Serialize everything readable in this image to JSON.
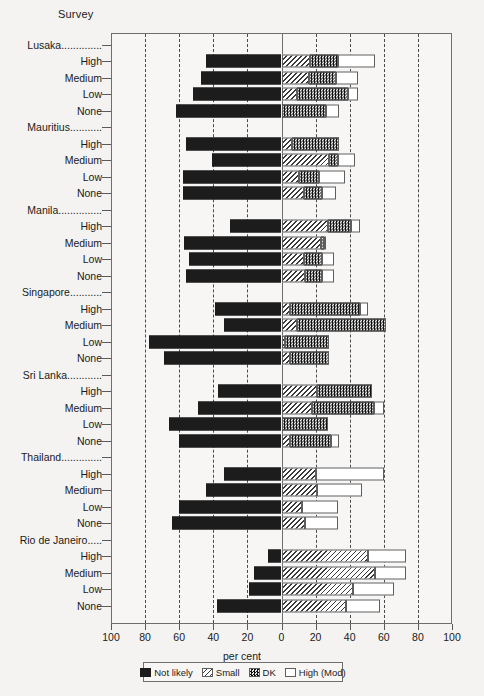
{
  "header": {
    "survey_label": "Survey"
  },
  "axis": {
    "x_title": "per cent",
    "x_ticks": [
      {
        "label": "100",
        "value": -100
      },
      {
        "label": "80",
        "value": -80
      },
      {
        "label": "60",
        "value": -60
      },
      {
        "label": "40",
        "value": -40
      },
      {
        "label": "20",
        "value": -20
      },
      {
        "label": "0",
        "value": 0
      },
      {
        "label": "20",
        "value": 20
      },
      {
        "label": "40",
        "value": 40
      },
      {
        "label": "60",
        "value": 60
      },
      {
        "label": "80",
        "value": 80
      },
      {
        "label": "100",
        "value": 100
      }
    ]
  },
  "legend": {
    "items": [
      {
        "key": "not_likely",
        "label": "Not likely",
        "swatch": "solid-black-swatch"
      },
      {
        "key": "small",
        "label": "Small",
        "swatch": "diagonal-hatch-swatch"
      },
      {
        "key": "dk",
        "label": "DK",
        "swatch": "dotted-dense-swatch"
      },
      {
        "key": "high_mod",
        "label": "High (Mod)",
        "swatch": "empty-white-swatch"
      }
    ]
  },
  "colors": {
    "not_likely": "#1c1c1c",
    "small": "#ffffff",
    "dk": "#111111",
    "high_mod": "#ffffff",
    "frame": "#6e6e6e",
    "grid": "#4a4a4a",
    "background": "#f4f3f1"
  },
  "chart_data": {
    "type": "bar",
    "title": "",
    "subtitle": "",
    "xlabel": "per cent",
    "ylabel": "Survey",
    "orientation": "horizontal",
    "stacked": true,
    "diverging": true,
    "xlim": [
      -100,
      100
    ],
    "grid": true,
    "legend_position": "bottom",
    "series": [
      {
        "name": "Not likely",
        "direction": "left"
      },
      {
        "name": "Small",
        "direction": "right"
      },
      {
        "name": "DK",
        "direction": "right"
      },
      {
        "name": "High (Mod)",
        "direction": "right"
      }
    ],
    "groups": [
      {
        "name": "Lusaka..............",
        "rows": [
          {
            "label": "High",
            "not_likely": 44,
            "small": 17,
            "dk": 16,
            "high_mod": 22
          },
          {
            "label": "Medium",
            "not_likely": 47,
            "small": 16,
            "dk": 16,
            "high_mod": 13
          },
          {
            "label": "Low",
            "not_likely": 52,
            "small": 9,
            "dk": 30,
            "high_mod": 6
          },
          {
            "label": "None",
            "not_likely": 62,
            "small": 0,
            "dk": 26,
            "high_mod": 8
          }
        ]
      },
      {
        "name": "Mauritius...........",
        "rows": [
          {
            "label": "High",
            "not_likely": 56,
            "small": 6,
            "dk": 28,
            "high_mod": 0
          },
          {
            "label": "Medium",
            "not_likely": 41,
            "small": 28,
            "dk": 5,
            "high_mod": 10
          },
          {
            "label": "Low",
            "not_likely": 58,
            "small": 10,
            "dk": 12,
            "high_mod": 15
          },
          {
            "label": "None",
            "not_likely": 58,
            "small": 13,
            "dk": 11,
            "high_mod": 8
          }
        ]
      },
      {
        "name": "Manila...............",
        "rows": [
          {
            "label": "High",
            "not_likely": 30,
            "small": 27,
            "dk": 14,
            "high_mod": 5
          },
          {
            "label": "Medium",
            "not_likely": 57,
            "small": 23,
            "dk": 2,
            "high_mod": 1
          },
          {
            "label": "Low",
            "not_likely": 54,
            "small": 13,
            "dk": 11,
            "high_mod": 7
          },
          {
            "label": "None",
            "not_likely": 56,
            "small": 14,
            "dk": 10,
            "high_mod": 7
          }
        ]
      },
      {
        "name": "Singapore...........",
        "rows": [
          {
            "label": "High",
            "not_likely": 39,
            "small": 5,
            "dk": 41,
            "high_mod": 5
          },
          {
            "label": "Medium",
            "not_likely": 34,
            "small": 9,
            "dk": 52,
            "high_mod": 0
          },
          {
            "label": "Low",
            "not_likely": 78,
            "small": 2,
            "dk": 26,
            "high_mod": 0
          },
          {
            "label": "None",
            "not_likely": 69,
            "small": 5,
            "dk": 23,
            "high_mod": 0
          }
        ]
      },
      {
        "name": "Sri Lanka............",
        "rows": [
          {
            "label": "High",
            "not_likely": 37,
            "small": 21,
            "dk": 32,
            "high_mod": 0
          },
          {
            "label": "Medium",
            "not_likely": 49,
            "small": 18,
            "dk": 36,
            "high_mod": 6
          },
          {
            "label": "Low",
            "not_likely": 66,
            "small": 0,
            "dk": 27,
            "high_mod": 0
          },
          {
            "label": "None",
            "not_likely": 60,
            "small": 5,
            "dk": 24,
            "high_mod": 5
          }
        ]
      },
      {
        "name": "Thailand..............",
        "rows": [
          {
            "label": "High",
            "not_likely": 34,
            "small": 20,
            "dk": 0,
            "high_mod": 40
          },
          {
            "label": "Medium",
            "not_likely": 44,
            "small": 21,
            "dk": 0,
            "high_mod": 26
          },
          {
            "label": "Low",
            "not_likely": 60,
            "small": 12,
            "dk": 0,
            "high_mod": 21
          },
          {
            "label": "None",
            "not_likely": 64,
            "small": 14,
            "dk": 0,
            "high_mod": 19
          }
        ]
      },
      {
        "name": "Rio de Janeiro.....",
        "rows": [
          {
            "label": "High",
            "not_likely": 8,
            "small": 51,
            "dk": 0,
            "high_mod": 22
          },
          {
            "label": "Medium",
            "not_likely": 16,
            "small": 55,
            "dk": 0,
            "high_mod": 18
          },
          {
            "label": "Low",
            "not_likely": 19,
            "small": 42,
            "dk": 0,
            "high_mod": 24
          },
          {
            "label": "None",
            "not_likely": 38,
            "small": 38,
            "dk": 0,
            "high_mod": 20
          }
        ]
      }
    ]
  }
}
